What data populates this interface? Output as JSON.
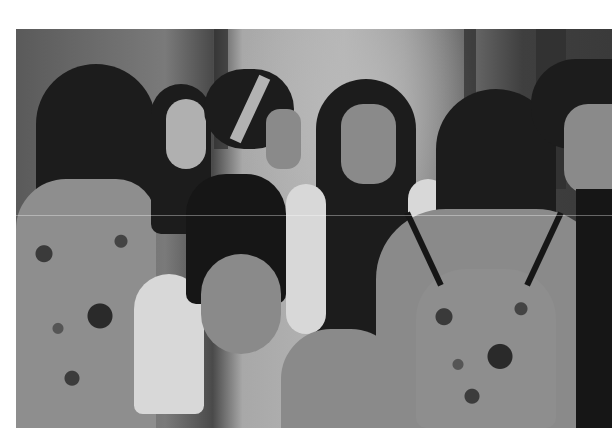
{
  "image": {
    "description": "Black-and-white photograph of a group of young women sitting in a circle on the ground, talking",
    "tone": "grayscale",
    "subjects": [
      {
        "position": "far-left",
        "desc": "woman with long dark hair, back partly turned, patterned top"
      },
      {
        "position": "left",
        "desc": "smiling woman with dark hair, light top"
      },
      {
        "position": "center-left",
        "desc": "woman in profile with dark hair in a bun and patterned headband, dark top"
      },
      {
        "position": "center",
        "desc": "smiling woman with long straight dark hair, light open shirt"
      },
      {
        "position": "center-right-foreground",
        "desc": "woman seen from behind wearing a patterned drawstring backpack"
      },
      {
        "position": "far-right",
        "desc": "two women in profile, one with curly hair and headband"
      }
    ]
  },
  "colors": {
    "background": "#ffffff",
    "photo_mid": "#8a8a8a",
    "photo_dark": "#1c1c1c",
    "photo_light": "#b5b5b5"
  }
}
